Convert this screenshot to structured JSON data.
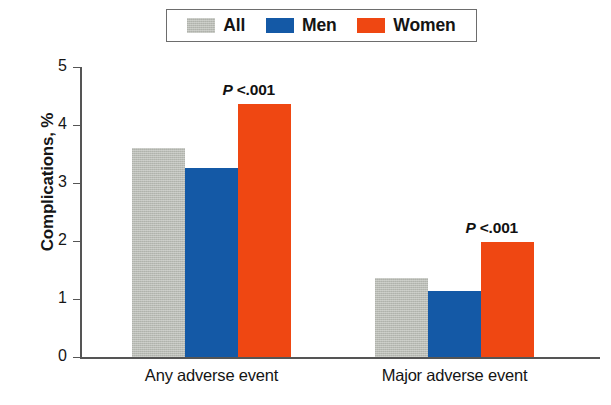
{
  "chart_data": {
    "type": "bar",
    "title": "",
    "xlabel": "",
    "ylabel": "Complications, %",
    "ylim": [
      0,
      5
    ],
    "yticks": [
      "0",
      "1",
      "2",
      "3",
      "4",
      "5"
    ],
    "grid": false,
    "legend_position": "top-center",
    "categories": [
      "Any adverse event",
      "Major adverse event"
    ],
    "series": [
      {
        "name": "All",
        "color": "#b9bcb5",
        "values": [
          3.6,
          1.37
        ]
      },
      {
        "name": "Men",
        "color": "#1459a6",
        "values": [
          3.26,
          1.13
        ]
      },
      {
        "name": "Women",
        "color": "#ef4712",
        "values": [
          4.36,
          1.99
        ]
      }
    ],
    "annotations": [
      {
        "text_prefix": "P",
        "text_rest": " <.001",
        "group": "Any adverse event"
      },
      {
        "text_prefix": "P",
        "text_rest": " <.001",
        "group": "Major adverse event"
      }
    ]
  },
  "legend": {
    "items": [
      {
        "label": "All",
        "color": "#b9bcb5"
      },
      {
        "label": "Men",
        "color": "#1459a6"
      },
      {
        "label": "Women",
        "color": "#ef4712"
      }
    ]
  },
  "axes": {
    "y_title": "Complications, %",
    "y_ticks": [
      "5",
      "4",
      "3",
      "2",
      "1",
      "0"
    ],
    "x_ticks": [
      "Any adverse event",
      "Major adverse event"
    ]
  },
  "annotations": {
    "p1_prefix": "P",
    "p1_rest": " <.001",
    "p2_prefix": "P",
    "p2_rest": " <.001"
  }
}
